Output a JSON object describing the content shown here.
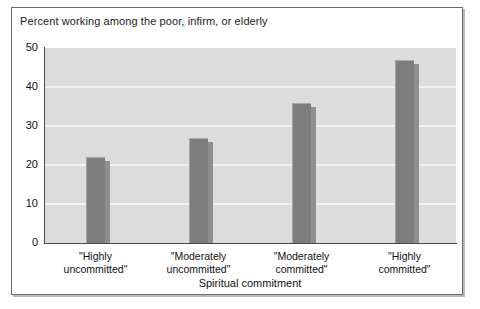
{
  "figure": {
    "title": "Percent working among the poor, infirm, or elderly",
    "x_axis_title": "Spiritual commitment"
  },
  "chart_data": {
    "type": "bar",
    "title": "Percent working among the poor, infirm, or elderly",
    "xlabel": "Spiritual commitment",
    "ylabel": "",
    "ylim": [
      0,
      50
    ],
    "yticks": [
      0,
      10,
      20,
      30,
      40,
      50
    ],
    "grid": true,
    "legend": null,
    "bar_color": "#7d7d7d",
    "plot_background": "#dcdcdc",
    "categories": [
      "\"Highly uncommitted\"",
      "\"Moderately uncommitted\"",
      "\"Moderately committed\"",
      "\"Highly committed\""
    ],
    "category_lines": [
      [
        "\"Highly",
        "uncommitted\""
      ],
      [
        "\"Moderately",
        "uncommitted\""
      ],
      [
        "\"Moderately",
        "committed\""
      ],
      [
        "\"Highly",
        "committed\""
      ]
    ],
    "values": [
      22,
      27,
      36,
      47
    ]
  },
  "y_ticks": [
    {
      "label": "50",
      "value": 50
    },
    {
      "label": "40",
      "value": 40
    },
    {
      "label": "30",
      "value": 30
    },
    {
      "label": "20",
      "value": 20
    },
    {
      "label": "10",
      "value": 10
    },
    {
      "label": "0",
      "value": 0
    }
  ]
}
